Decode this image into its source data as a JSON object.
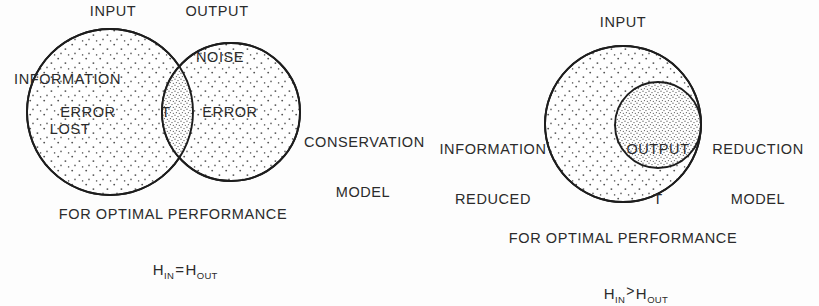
{
  "figure": {
    "background_color": "#fdfdfd",
    "ink_color": "#2b2b2b"
  },
  "diagrams": [
    {
      "id": "conservation",
      "model_label": "CONSERVATION\nMODEL",
      "model_label_line1": "CONSERVATION",
      "model_label_line2": "MODEL",
      "top_labels": {
        "input": "INPUT",
        "output": "OUTPUT"
      },
      "region_labels": {
        "information_lost_line1": "INFORMATION",
        "information_lost_line2": "LOST",
        "noise": "NOISE",
        "error_left": "ERROR",
        "error_right": "ERROR",
        "intersection": "T"
      },
      "caption": "FOR OPTIMAL PERFORMANCE",
      "formula": {
        "lhs_base": "H",
        "lhs_sub": "IN",
        "operator": "=",
        "rhs_base": "H",
        "rhs_sub": "OUT",
        "plain": "H IN = H OUT"
      }
    },
    {
      "id": "reduction",
      "model_label_line1": "REDUCTION",
      "model_label_line2": "MODEL",
      "top_labels": {
        "input": "INPUT"
      },
      "region_labels": {
        "information_reduced_line1": "INFORMATION",
        "information_reduced_line2": "REDUCED",
        "output_line1": "OUTPUT",
        "output_line2": "T"
      },
      "caption": "FOR OPTIMAL PERFORMANCE",
      "formula": {
        "lhs_base": "H",
        "lhs_sub": "IN",
        "operator": ">",
        "rhs_base": "H",
        "rhs_sub": "OUT",
        "plain": "H IN > H OUT"
      }
    }
  ]
}
